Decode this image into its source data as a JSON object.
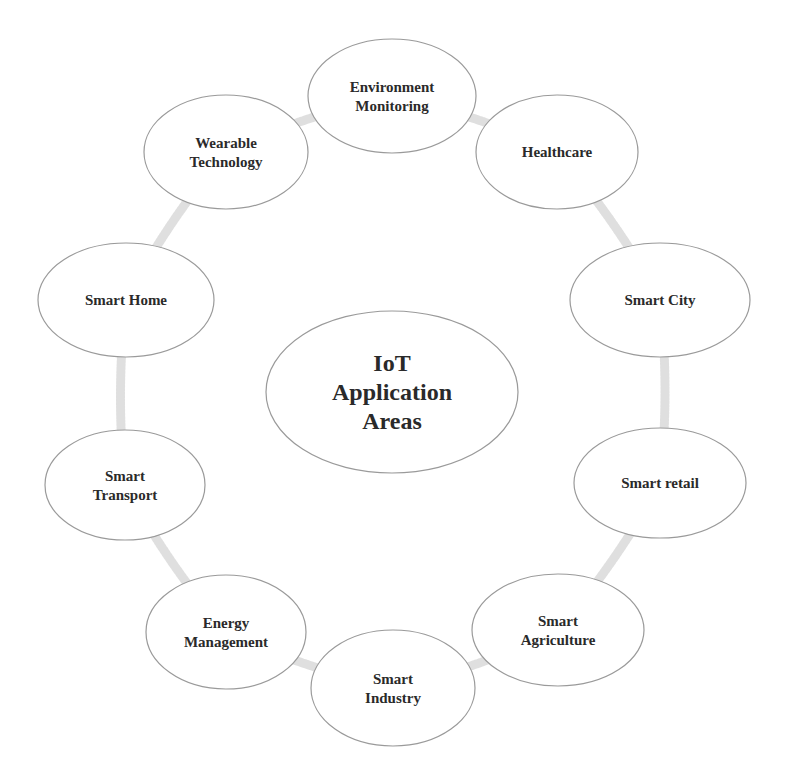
{
  "center": {
    "lines": [
      "IoT",
      "Application",
      "Areas"
    ],
    "cx": 392,
    "cy": 392,
    "rx": 126,
    "ry": 81
  },
  "nodes": [
    {
      "id": "environment-monitoring",
      "lines": [
        "Environment",
        "Monitoring"
      ],
      "cx": 392,
      "cy": 96,
      "rx": 84,
      "ry": 57
    },
    {
      "id": "healthcare",
      "lines": [
        "Healthcare"
      ],
      "cx": 557,
      "cy": 152,
      "rx": 81,
      "ry": 57
    },
    {
      "id": "smart-city",
      "lines": [
        "Smart City"
      ],
      "cx": 660,
      "cy": 300,
      "rx": 90,
      "ry": 57
    },
    {
      "id": "smart-retail",
      "lines": [
        "Smart retail"
      ],
      "cx": 660,
      "cy": 483,
      "rx": 86,
      "ry": 55
    },
    {
      "id": "smart-agriculture",
      "lines": [
        "Smart",
        "Agriculture"
      ],
      "cx": 558,
      "cy": 630,
      "rx": 86,
      "ry": 56
    },
    {
      "id": "smart-industry",
      "lines": [
        "Smart",
        "Industry"
      ],
      "cx": 393,
      "cy": 688,
      "rx": 82,
      "ry": 58
    },
    {
      "id": "energy-management",
      "lines": [
        "Energy",
        "Management"
      ],
      "cx": 226,
      "cy": 632,
      "rx": 80,
      "ry": 57
    },
    {
      "id": "smart-transport",
      "lines": [
        "Smart",
        "Transport"
      ],
      "cx": 125,
      "cy": 485,
      "rx": 80,
      "ry": 55
    },
    {
      "id": "smart-home",
      "lines": [
        "Smart Home"
      ],
      "cx": 126,
      "cy": 300,
      "rx": 88,
      "ry": 57
    },
    {
      "id": "wearable-technology",
      "lines": [
        "Wearable",
        "Technology"
      ],
      "cx": 226,
      "cy": 152,
      "rx": 82,
      "ry": 57
    }
  ],
  "colors": {
    "outline": "#9a9a9a",
    "connector": "#d9d9d9",
    "text": "#2a2a2a",
    "background": "#ffffff"
  }
}
